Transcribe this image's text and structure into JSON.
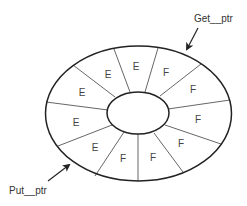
{
  "diagram": {
    "type": "circular-buffer",
    "labels": {
      "get_ptr": "Get__ptr",
      "put_ptr": "Put__ptr"
    },
    "legend": {
      "E": "empty slot",
      "F": "full slot"
    },
    "segments": [
      {
        "label": "E",
        "x": 82,
        "y": 92
      },
      {
        "label": "E",
        "x": 108,
        "y": 74
      },
      {
        "label": "E",
        "x": 136,
        "y": 66
      },
      {
        "label": "F",
        "x": 166,
        "y": 72
      },
      {
        "label": "F",
        "x": 193,
        "y": 89
      },
      {
        "label": "F",
        "x": 198,
        "y": 119
      },
      {
        "label": "F",
        "x": 181,
        "y": 143
      },
      {
        "label": "F",
        "x": 153,
        "y": 157
      },
      {
        "label": "F",
        "x": 123,
        "y": 158
      },
      {
        "label": "E",
        "x": 95,
        "y": 147
      },
      {
        "label": "E",
        "x": 76,
        "y": 122
      }
    ],
    "colors": {
      "stroke": "#222222",
      "divider": "#555555",
      "text": "#333333"
    }
  }
}
